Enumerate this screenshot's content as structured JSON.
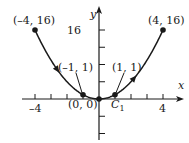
{
  "diagram": {
    "curve": "y = x^2",
    "x_range": [
      -4,
      4
    ],
    "orientation": "from (-4, 16) through (0, 0) to (4, 16)",
    "axes": {
      "x_label": "x",
      "y_label": "y",
      "x_tick_labels": [
        {
          "value": -4,
          "text": "–4"
        },
        {
          "value": 4,
          "text": "4"
        }
      ],
      "y_tick_labels": [
        {
          "value": 16,
          "text": "16"
        }
      ],
      "x_ticks": [
        -4,
        -3,
        -2,
        -1,
        1,
        2,
        3,
        4
      ],
      "y_ticks": [
        -12,
        -8,
        -4,
        4,
        8,
        12,
        16
      ]
    },
    "points": [
      {
        "x": -4,
        "y": 16,
        "label": "(–4, 16)"
      },
      {
        "x": -1,
        "y": 1,
        "label": "(–1, 1)"
      },
      {
        "x": 0,
        "y": 0,
        "label": "(0, 0)"
      },
      {
        "x": 1,
        "y": 1,
        "label": "(1, 1)"
      },
      {
        "x": 4,
        "y": 16,
        "label": "(4, 16)"
      }
    ],
    "curve_label": {
      "main": "C",
      "sub": "1"
    },
    "color": "#1a1a1a"
  }
}
